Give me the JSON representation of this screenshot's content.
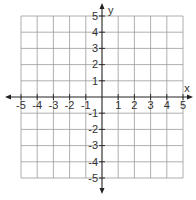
{
  "plane": {
    "x_axis_label": "x",
    "y_axis_label": "y",
    "x_range": [
      -5,
      5
    ],
    "y_range": [
      -5,
      5
    ],
    "x_ticks": [
      "-5",
      "-4",
      "-3",
      "-2",
      "-1",
      "1",
      "2",
      "3",
      "4",
      "5"
    ],
    "y_ticks": [
      "5",
      "4",
      "3",
      "2",
      "1",
      "-1",
      "-2",
      "-3",
      "-4",
      "-5"
    ],
    "grid_color": "#9a9a9a",
    "axis_color": "#222222"
  }
}
